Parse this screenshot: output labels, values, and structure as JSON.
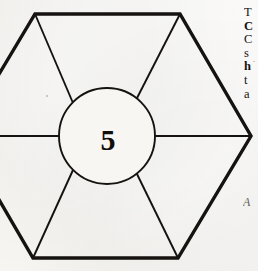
{
  "page": {
    "kind": "scanned-book-page-fragment",
    "width": 258,
    "height": 271,
    "paper_color": "#f6f5f2",
    "ink_color": "#15120f"
  },
  "figure": {
    "name": "hexagon-with-central-circle",
    "center_label": "5",
    "shape": "hexagon",
    "spoke_count": 6,
    "stroke_color": "#15120f",
    "hexagon": {
      "outline_width": 3.4,
      "clipped_edge": "left",
      "vertices": [
        {
          "name": "top-left",
          "x": 35,
          "y": 14
        },
        {
          "name": "top-right",
          "x": 180,
          "y": 14
        },
        {
          "name": "right",
          "x": 251,
          "y": 136
        },
        {
          "name": "bottom-right",
          "x": 178,
          "y": 258
        },
        {
          "name": "bottom-left",
          "x": 33,
          "y": 258
        },
        {
          "name": "left",
          "x": -38,
          "y": 136
        }
      ]
    },
    "circle": {
      "cx": 107,
      "cy": 136,
      "r": 48,
      "stroke_width": 1.9
    },
    "spokes": [
      {
        "name": "spoke-top-left",
        "to_x": 35,
        "to_y": 14
      },
      {
        "name": "spoke-top-right",
        "to_x": 180,
        "to_y": 14
      },
      {
        "name": "spoke-right",
        "to_x": 251,
        "to_y": 136
      },
      {
        "name": "spoke-bottom-right",
        "to_x": 178,
        "to_y": 258
      },
      {
        "name": "spoke-bottom-left",
        "to_x": 33,
        "to_y": 258
      },
      {
        "name": "spoke-left",
        "to_x": -38,
        "to_y": 136
      }
    ]
  },
  "text_column": {
    "note": "right margin body text, cropped by page edge; only the leading glyph of each line is visible",
    "lines": [
      {
        "text": "T",
        "bold": false
      },
      {
        "text": "C",
        "bold": true
      },
      {
        "text": "C",
        "bold": false
      },
      {
        "text": "s",
        "bold": false
      },
      {
        "text": "h",
        "bold": true
      },
      {
        "text": "t",
        "bold": false
      },
      {
        "text": "a",
        "bold": false
      }
    ]
  },
  "caption_mark": {
    "text": "A",
    "style": "italic"
  }
}
